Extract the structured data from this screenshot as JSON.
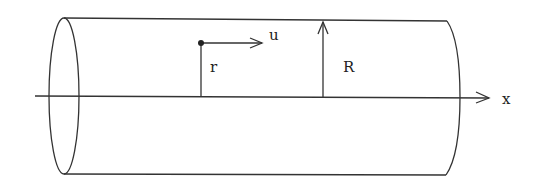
{
  "diagram": {
    "labels": {
      "velocity": "u",
      "radial_position": "r",
      "pipe_radius": "R",
      "axis": "x"
    },
    "colors": {
      "stroke": "#333333",
      "background": "#ffffff"
    }
  }
}
